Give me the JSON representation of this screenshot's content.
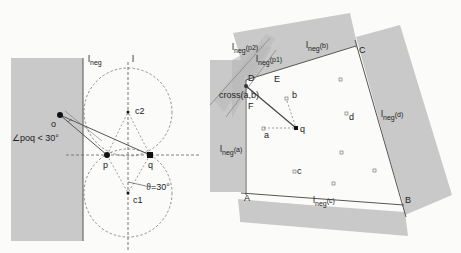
{
  "left_figure": {
    "line_labels": {
      "l_neg": "l",
      "l_neg_sub": "neg",
      "l": "l"
    },
    "points": {
      "o": "o",
      "p": "p",
      "q": "q",
      "c1": "c1",
      "c2": "c2"
    },
    "angle_condition": "∠poq < 30°",
    "theta_label": "ϑ=30°"
  },
  "right_figure": {
    "regions": {
      "a": {
        "main": "l",
        "sub": "neg",
        "arg": "(a)"
      },
      "b": {
        "main": "l",
        "sub": "neg",
        "arg": "(b)"
      },
      "c": {
        "main": "l",
        "sub": "neg",
        "arg": "(c)"
      },
      "d": {
        "main": "l",
        "sub": "neg",
        "arg": "(d)"
      },
      "p1": {
        "main": "l",
        "sub": "neg",
        "arg": "(p1)"
      },
      "p2": {
        "main": "l",
        "sub": "neg",
        "arg": "(p2)"
      }
    },
    "corners": {
      "A": "A",
      "B": "B",
      "C": "C",
      "D": "D"
    },
    "points": {
      "E": "E",
      "F": "F",
      "a": "a",
      "b": "b",
      "c": "c",
      "d": "d",
      "q": "q"
    },
    "cross_label": "cross(a,b)"
  }
}
